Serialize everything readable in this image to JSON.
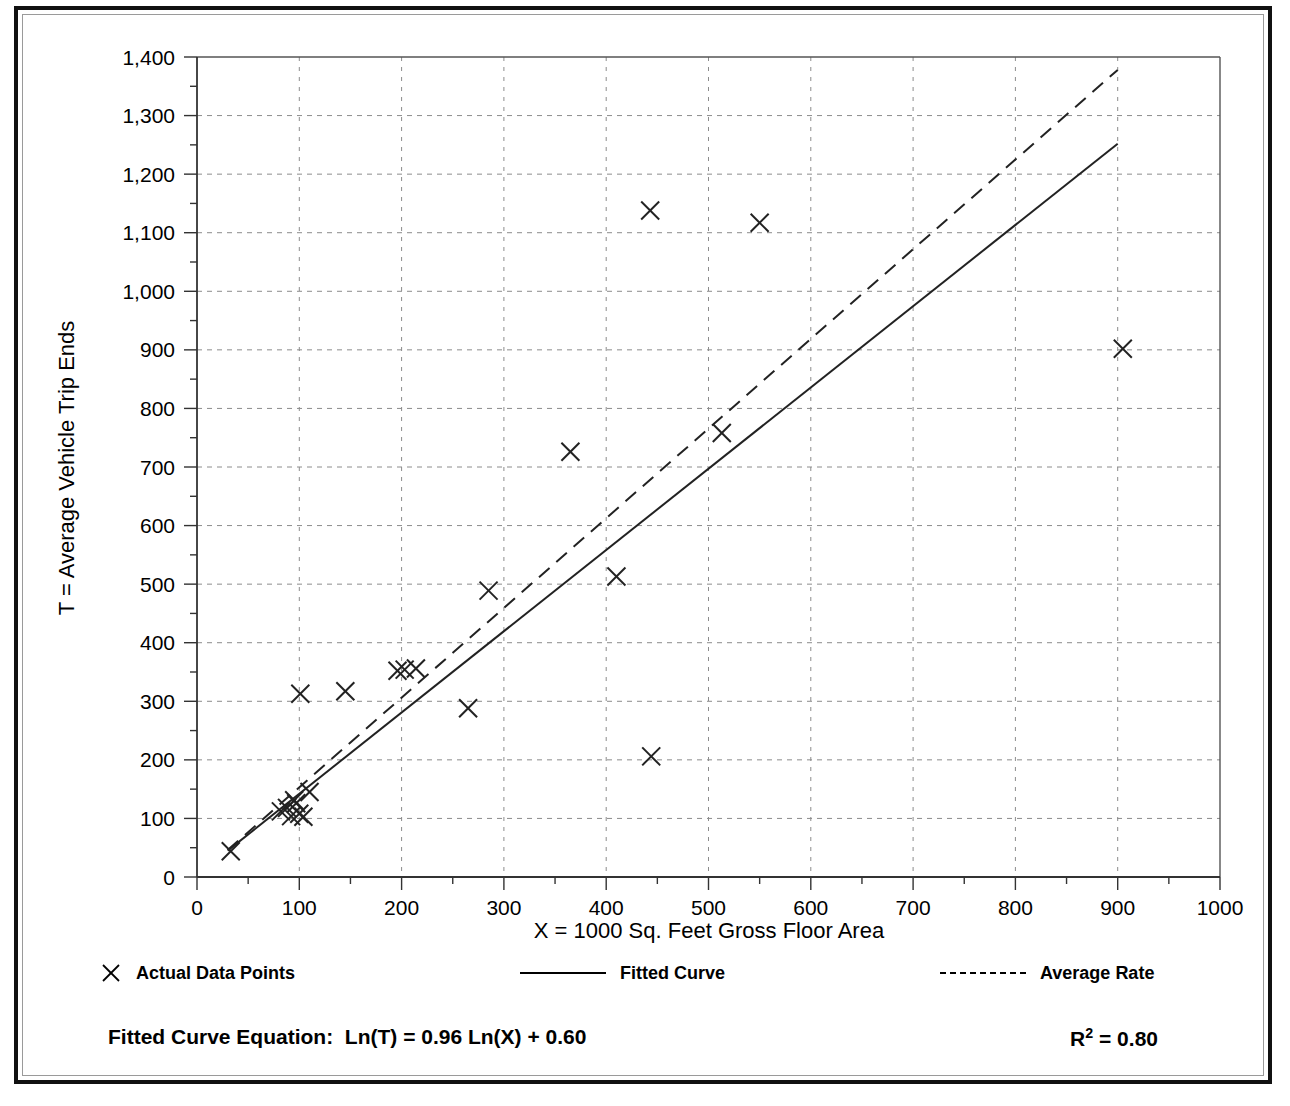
{
  "chart_data": {
    "type": "scatter",
    "title": "",
    "xlabel": "X = 1000 Sq. Feet Gross Floor Area",
    "ylabel": "T = Average Vehicle Trip Ends",
    "xlim": [
      0,
      1000
    ],
    "ylim": [
      0,
      1400
    ],
    "x_major_step": 100,
    "x_minor_step": 50,
    "y_major_step": 100,
    "y_minor_step": 50,
    "grid": "dashed-both",
    "legend_position": "bottom",
    "x_ticks": [
      "0",
      "100",
      "200",
      "300",
      "400",
      "500",
      "600",
      "700",
      "800",
      "900",
      "1000"
    ],
    "y_ticks": [
      "0",
      "100",
      "200",
      "300",
      "400",
      "500",
      "600",
      "700",
      "800",
      "900",
      "1,000",
      "1,100",
      "1,200",
      "1,300",
      "1,400"
    ],
    "series": [
      {
        "name": "Actual Data Points",
        "marker": "x",
        "points": [
          [
            33,
            44
          ],
          [
            82,
            112
          ],
          [
            88,
            118
          ],
          [
            92,
            104
          ],
          [
            95,
            131
          ],
          [
            97,
            126
          ],
          [
            100,
            108
          ],
          [
            101,
            313
          ],
          [
            104,
            103
          ],
          [
            110,
            145
          ],
          [
            145,
            317
          ],
          [
            196,
            352
          ],
          [
            203,
            354
          ],
          [
            214,
            356
          ],
          [
            265,
            288
          ],
          [
            285,
            489
          ],
          [
            365,
            726
          ],
          [
            410,
            513
          ],
          [
            443,
            1138
          ],
          [
            444,
            206
          ],
          [
            513,
            758
          ],
          [
            550,
            1117
          ],
          [
            905,
            902
          ]
        ]
      },
      {
        "name": "Fitted Curve",
        "style": "solid",
        "equation": "Ln(T) = 0.96 Ln(X) + 0.60",
        "intercept_ln": 0.6,
        "slope_ln": 0.96,
        "r_squared": 0.8,
        "endpoints": [
          [
            30,
            45
          ],
          [
            900,
            1252
          ]
        ]
      },
      {
        "name": "Average Rate",
        "style": "dashed",
        "endpoints": [
          [
            30,
            46
          ],
          [
            900,
            1378
          ]
        ]
      }
    ]
  },
  "axes": {
    "x_title": "X = 1000 Sq. Feet Gross Floor Area",
    "y_title": "T = Average Vehicle Trip Ends"
  },
  "legend": {
    "items": [
      {
        "label": "Actual Data Points",
        "swatch": "x-marker-icon",
        "left": 0
      },
      {
        "label": "Fitted Curve",
        "swatch": "solid-line-icon",
        "left": 420
      },
      {
        "label": "Average Rate",
        "swatch": "dashed-line-icon",
        "left": 840
      }
    ]
  },
  "footer": {
    "equation_label": "Fitted Curve Equation:",
    "equation": "Ln(T) = 0.96 Ln(X) + 0.60",
    "r_squared_prefix": "R",
    "r_squared_exp": "2",
    "r_squared_value": " = 0.80"
  },
  "colors": {
    "ink": "#000000",
    "grid": "#8c8c8c",
    "frame": "#111111",
    "paper": "#ffffff"
  }
}
